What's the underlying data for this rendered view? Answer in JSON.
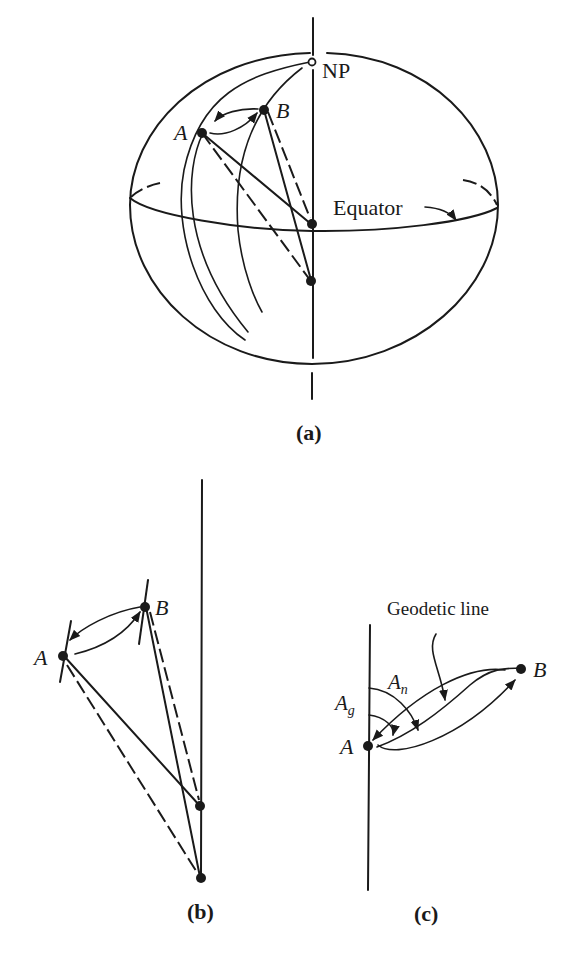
{
  "figure": {
    "panel_a": {
      "caption": "(a)",
      "labels": {
        "north_pole": "NP",
        "point_a": "A",
        "point_b": "B",
        "equator": "Equator"
      }
    },
    "panel_b": {
      "caption": "(b)",
      "labels": {
        "point_a": "A",
        "point_b": "B"
      }
    },
    "panel_c": {
      "caption": "(c)",
      "labels": {
        "geodetic_line": "Geodetic line",
        "azimuth_n": "A",
        "azimuth_n_sub": "n",
        "azimuth_g": "A",
        "azimuth_g_sub": "g",
        "point_a": "A",
        "point_b": "B"
      }
    },
    "colors": {
      "ink": "#1a1a1a",
      "background": "#ffffff"
    }
  }
}
